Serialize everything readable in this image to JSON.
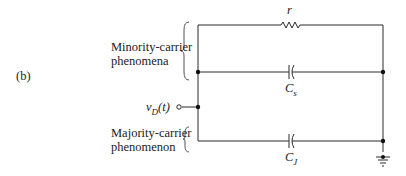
{
  "figure": {
    "panel_label": "(b)",
    "labels": {
      "minority_line1": "Minority-carrier",
      "minority_line2": "phenomena",
      "majority_line1": "Majority-carrier",
      "majority_line2": "phenomenon",
      "input_label": "v_D(t)",
      "input_v": "v",
      "input_sub": "D",
      "input_t": "(t)"
    },
    "components": {
      "resistor": {
        "name": "r"
      },
      "cap_s": {
        "name": "C",
        "sub": "s"
      },
      "cap_j": {
        "name": "C",
        "sub": "J"
      }
    },
    "colors": {
      "line": "#2a2a2a",
      "text": "#222222",
      "brace": "#555555"
    }
  }
}
